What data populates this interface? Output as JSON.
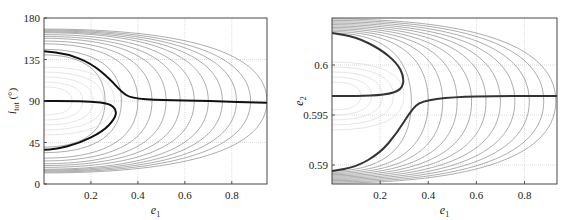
{
  "chart_data": [
    {
      "type": "line",
      "subtype": "contour",
      "title": "",
      "xlabel": "e1",
      "xlabel_main": "e",
      "xlabel_sub": "1",
      "ylabel": "i_tot (°)",
      "ylabel_main": "i",
      "ylabel_sub": "tot",
      "ylabel_unit": " (°)",
      "xlim": [
        0,
        0.95
      ],
      "ylim": [
        0,
        180
      ],
      "xticks": [
        0.2,
        0.4,
        0.6,
        0.8
      ],
      "xtick_labels": [
        "0.2",
        "0.4",
        "0.6",
        "0.8"
      ],
      "yticks": [
        0,
        45,
        90,
        135,
        180
      ],
      "ytick_labels": [
        "0",
        "45",
        "90",
        "135",
        "180"
      ],
      "grid": true,
      "legend": null,
      "contour_levels_extent_e1": [
        0.26,
        0.33,
        0.4,
        0.46,
        0.52,
        0.58,
        0.64,
        0.7,
        0.76,
        0.82,
        0.88,
        0.95
      ],
      "contour_levels_halfwidth_deg": [
        50,
        56,
        62,
        65,
        68,
        70,
        72,
        74,
        75,
        76,
        77,
        78
      ],
      "bold_curves": [
        {
          "name": "separatrix-upper",
          "points": [
            [
              0,
              144
            ],
            [
              0.1,
              141
            ],
            [
              0.2,
              131
            ],
            [
              0.28,
              114
            ],
            [
              0.33,
              100
            ],
            [
              0.37,
              93
            ],
            [
              0.5,
              91
            ],
            [
              0.7,
              90
            ],
            [
              0.95,
              88
            ]
          ]
        },
        {
          "name": "separatrix-lower-lobe",
          "points": [
            [
              0,
              90
            ],
            [
              0.1,
              90
            ],
            [
              0.2,
              89.5
            ],
            [
              0.28,
              87
            ],
            [
              0.31,
              80
            ],
            [
              0.3,
              70
            ],
            [
              0.25,
              57
            ],
            [
              0.15,
              44
            ],
            [
              0.05,
              38
            ],
            [
              0,
              37
            ]
          ]
        }
      ]
    },
    {
      "type": "line",
      "subtype": "contour",
      "title": "",
      "xlabel": "e1",
      "xlabel_main": "e",
      "xlabel_sub": "1",
      "ylabel": "e2",
      "ylabel_main": "e",
      "ylabel_sub": "2",
      "ylabel_unit": "",
      "xlim": [
        0,
        0.935
      ],
      "ylim": [
        0.5881,
        0.6047
      ],
      "xticks": [
        0.2,
        0.4,
        0.6,
        0.8
      ],
      "xtick_labels": [
        "0.2",
        "0.4",
        "0.6",
        "0.8"
      ],
      "yticks": [
        0.59,
        0.595,
        0.6
      ],
      "ytick_labels": [
        "0.59",
        "0.595",
        "0.6"
      ],
      "grid": true,
      "legend": null,
      "contour_levels_extent_e1": [
        0.33,
        0.4,
        0.46,
        0.52,
        0.58,
        0.64,
        0.7,
        0.76,
        0.82,
        0.88,
        0.93
      ],
      "bold_curves": [
        {
          "name": "separatrix-upper-lobe",
          "points": [
            [
              0,
              0.6032
            ],
            [
              0.1,
              0.6028
            ],
            [
              0.2,
              0.6016
            ],
            [
              0.27,
              0.6002
            ],
            [
              0.3,
              0.5988
            ],
            [
              0.29,
              0.5975
            ],
            [
              0.22,
              0.597
            ],
            [
              0.1,
              0.5969
            ],
            [
              0,
              0.5969
            ]
          ]
        },
        {
          "name": "separatrix-lower",
          "points": [
            [
              0,
              0.5894
            ],
            [
              0.1,
              0.5898
            ],
            [
              0.2,
              0.5912
            ],
            [
              0.27,
              0.5932
            ],
            [
              0.33,
              0.5955
            ],
            [
              0.37,
              0.5964
            ],
            [
              0.5,
              0.5968
            ],
            [
              0.7,
              0.5969
            ],
            [
              0.935,
              0.5969
            ]
          ]
        }
      ]
    }
  ]
}
